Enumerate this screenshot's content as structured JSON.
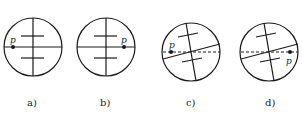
{
  "figure": {
    "panels": [
      {
        "label": "a)",
        "point_label": "p",
        "point_position": "left end of horizontal line",
        "reticle": "upright"
      },
      {
        "label": "b)",
        "point_label": "p",
        "point_position": "right end of horizontal line",
        "reticle": "upright"
      },
      {
        "label": "c)",
        "point_label": "p",
        "point_position": "left end, on dashed horizontal reference",
        "reticle": "rotated"
      },
      {
        "label": "d)",
        "point_label": "p",
        "point_position": "right end, below tilted line on dashed reference",
        "reticle": "rotated"
      }
    ],
    "colors": {
      "stroke": "#1a1a1a",
      "background": "#ffffff"
    }
  }
}
